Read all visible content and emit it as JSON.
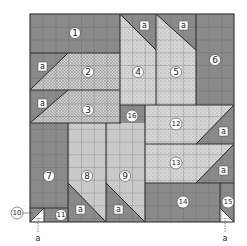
{
  "diagram": {
    "type": "quilt-block-piecing-diagram",
    "colors": {
      "dark": "#8a8a8a",
      "light_plain": "#c9c9c9",
      "speckled": "#d4d4d4",
      "crosshatch": "#bdbdbd",
      "grid_line": "#5a5a5a",
      "outline": "#333333",
      "white": "#ffffff"
    },
    "pieces": [
      {
        "id": "1",
        "label": "1"
      },
      {
        "id": "2",
        "label": "2"
      },
      {
        "id": "3",
        "label": "3"
      },
      {
        "id": "4",
        "label": "4"
      },
      {
        "id": "5",
        "label": "5"
      },
      {
        "id": "6",
        "label": "6"
      },
      {
        "id": "7",
        "label": "7"
      },
      {
        "id": "8",
        "label": "8"
      },
      {
        "id": "9",
        "label": "9"
      },
      {
        "id": "10",
        "label": "10"
      },
      {
        "id": "11",
        "label": "11"
      },
      {
        "id": "12",
        "label": "12"
      },
      {
        "id": "13",
        "label": "13"
      },
      {
        "id": "14",
        "label": "14"
      },
      {
        "id": "15",
        "label": "15"
      },
      {
        "id": "16",
        "label": "16"
      }
    ],
    "triangle_label": "a",
    "callouts": [
      {
        "target": "10",
        "label": "a"
      },
      {
        "target": "15",
        "label": "a"
      }
    ]
  }
}
